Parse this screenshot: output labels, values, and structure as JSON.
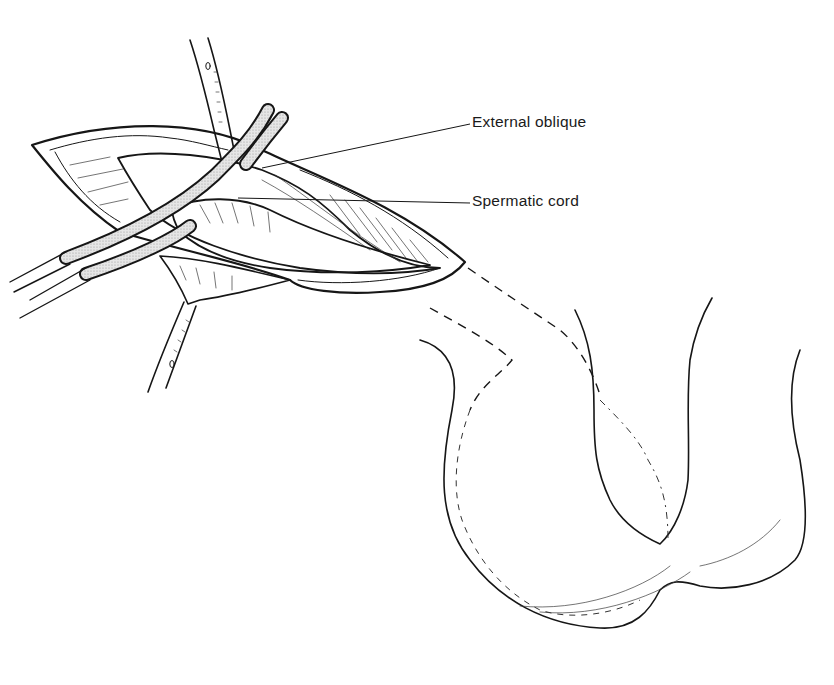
{
  "figure": {
    "labels": {
      "external_oblique": "External oblique",
      "spermatic_cord": "Spermatic cord"
    },
    "colors": {
      "ink": "#161616",
      "retractor_fill": "#d9d9d9",
      "background": "#ffffff"
    }
  }
}
